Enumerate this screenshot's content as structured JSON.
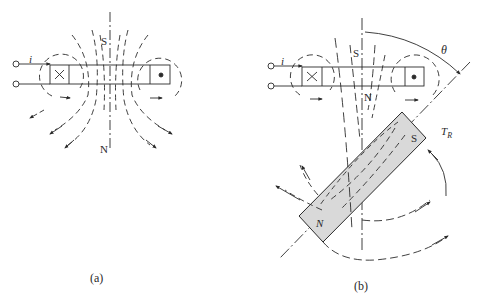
{
  "figure": {
    "panels": [
      {
        "id": "a",
        "caption": "(a)",
        "current_label": "i",
        "pole_top": "S",
        "pole_bottom": "N",
        "coil_left_symbol": "current-into-page",
        "coil_right_symbol": "current-out-of-page"
      },
      {
        "id": "b",
        "caption": "(b)",
        "current_label": "i",
        "pole_top": "S",
        "pole_bottom": "N",
        "angle_label": "θ",
        "torque_label": "T",
        "torque_subscript": "R",
        "magnet_pole_upper": "S",
        "magnet_pole_lower": "N",
        "coil_left_symbol": "current-into-page",
        "coil_right_symbol": "current-out-of-page"
      }
    ],
    "colors": {
      "line": "#2a2a2a",
      "magnet_fill": "#d9d9d9",
      "background": "#ffffff"
    }
  }
}
